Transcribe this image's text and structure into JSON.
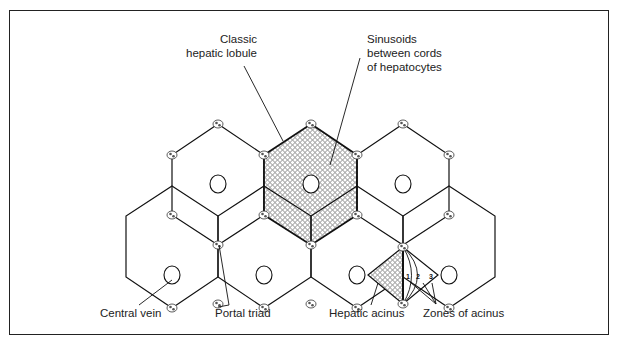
{
  "figure": {
    "labels": {
      "classic_lobule": [
        "Classic",
        "hepatic lobule"
      ],
      "sinusoids": [
        "Sinusoids",
        "between cords",
        "of hepatocytes"
      ],
      "central_vein": "Central vein",
      "portal_triad": "Portal triad",
      "hepatic_acinus": "Hepatic acinus",
      "zones_of_acinus": "Zones of acinus"
    },
    "zones": [
      "1",
      "2",
      "3"
    ]
  }
}
